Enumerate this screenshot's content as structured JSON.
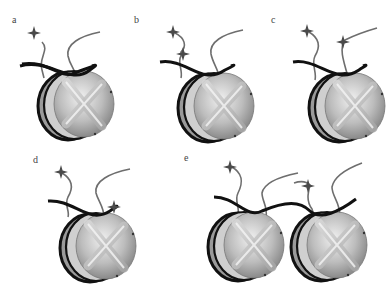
{
  "figure": {
    "colors": {
      "dna": "#111111",
      "tail": "#6e6e6e",
      "mark": "#4a4a4a",
      "octamer_light": "#e4e4e4",
      "octamer_dark": "#8a8a8a",
      "background": "#ffffff"
    },
    "panels": [
      {
        "id": "a",
        "label": "a",
        "nucleosomes": 1,
        "marks": 1
      },
      {
        "id": "b",
        "label": "b",
        "nucleosomes": 1,
        "marks": 2
      },
      {
        "id": "c",
        "label": "c",
        "nucleosomes": 1,
        "marks": 2
      },
      {
        "id": "d",
        "label": "d",
        "nucleosomes": 1,
        "marks": 2
      },
      {
        "id": "e",
        "label": "e",
        "nucleosomes": 2,
        "marks": 2
      }
    ]
  }
}
